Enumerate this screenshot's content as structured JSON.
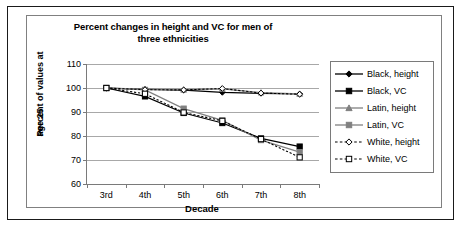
{
  "chart_data": {
    "type": "line",
    "title": "Percent changes in height and VC for men of three ethnicities",
    "title_line1": "Percent changes in height and VC for men of",
    "title_line2": "three ethnicities",
    "xlabel": "Decade",
    "ylabel": "Percent of values at age 25",
    "ylabel_line1": "Percent of values at",
    "ylabel_line2": "age 25",
    "categories": [
      "3rd",
      "4th",
      "5th",
      "6th",
      "7th",
      "8th"
    ],
    "x": [
      3,
      4,
      5,
      6,
      7,
      8
    ],
    "ylim": [
      60,
      110
    ],
    "yticks": [
      60,
      70,
      80,
      90,
      100,
      110
    ],
    "grid": true,
    "legend_position": "right",
    "series": [
      {
        "name": "Black, height",
        "values": [
          100.0,
          99.4,
          99.1,
          98.2,
          97.8,
          97.5
        ],
        "color": "#000000",
        "marker": "diamond",
        "fill": "#000000",
        "dash": false
      },
      {
        "name": "Black, VC",
        "values": [
          100.0,
          96.5,
          89.6,
          85.4,
          79.0,
          75.6
        ],
        "color": "#000000",
        "marker": "square",
        "fill": "#000000",
        "dash": false
      },
      {
        "name": "Latin, height",
        "values": [
          100.0,
          99.5,
          99.3,
          99.6,
          98.1,
          97.6
        ],
        "color": "#808080",
        "marker": "triangle",
        "fill": "#808080",
        "dash": false
      },
      {
        "name": "Latin, VC",
        "values": [
          100.0,
          99.2,
          91.4,
          86.5,
          78.3,
          73.3
        ],
        "color": "#808080",
        "marker": "square",
        "fill": "#808080",
        "dash": false
      },
      {
        "name": "White, height",
        "values": [
          100.0,
          99.3,
          99.2,
          99.8,
          97.9,
          97.4
        ],
        "color": "#000000",
        "marker": "diamond",
        "fill": "#ffffff",
        "dash": true
      },
      {
        "name": "White, VC",
        "values": [
          100.0,
          97.6,
          89.8,
          86.3,
          78.7,
          71.1
        ],
        "color": "#000000",
        "marker": "square",
        "fill": "#ffffff",
        "dash": true
      }
    ]
  }
}
